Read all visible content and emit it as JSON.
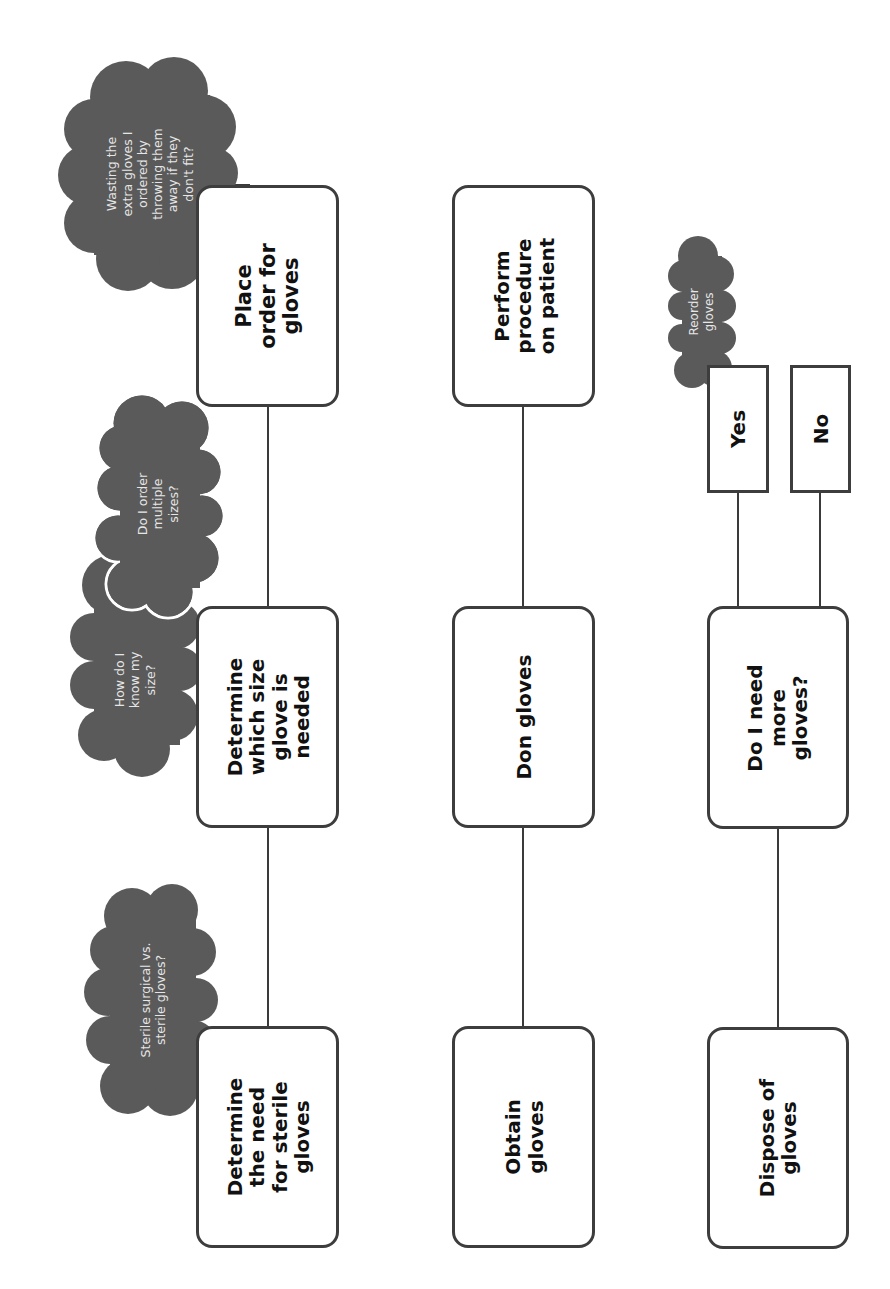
{
  "diagram": {
    "type": "flowchart",
    "orientation": "rotated-90-ccw",
    "colors": {
      "background": "#ffffff",
      "box_border": "#3d3d3d",
      "box_text": "#111111",
      "cloud_fill": "#5a5a5a",
      "cloud_text": "#e6e6e6",
      "connector": "#3a3a3a"
    },
    "columns": [
      {
        "steps": [
          {
            "id": "step-determine-need",
            "label": "Determine the need for sterile gloves"
          },
          {
            "id": "step-determine-size",
            "label": "Determine which size glove is needed"
          },
          {
            "id": "step-place-order",
            "label": "Place order for gloves"
          }
        ]
      },
      {
        "steps": [
          {
            "id": "step-obtain",
            "label": "Obtain gloves"
          },
          {
            "id": "step-don",
            "label": "Don gloves"
          },
          {
            "id": "step-perform",
            "label": "Perform procedure on patient"
          }
        ]
      },
      {
        "steps": [
          {
            "id": "step-dispose",
            "label": "Dispose of gloves"
          },
          {
            "id": "step-need-more",
            "label": "Do I need more gloves?"
          }
        ],
        "branches": [
          {
            "id": "branch-yes",
            "label": "Yes"
          },
          {
            "id": "branch-no",
            "label": "No"
          }
        ]
      }
    ],
    "clouds": [
      {
        "id": "cloud-sterile",
        "text": "Sterile surgical vs. sterile gloves?"
      },
      {
        "id": "cloud-know-size",
        "text": "How do I know my size?"
      },
      {
        "id": "cloud-multiple-sizes",
        "text": "Do I order multiple sizes?"
      },
      {
        "id": "cloud-wasting",
        "text": "Wasting the extra gloves I ordered by throwing them away if they don't fit?"
      },
      {
        "id": "cloud-reorder",
        "text": "Reorder gloves"
      }
    ]
  },
  "labels": {
    "place_order": [
      "Place",
      "order for",
      "gloves"
    ],
    "determine_size": [
      "Determine",
      "which size",
      "glove is",
      "needed"
    ],
    "determine_need": [
      "Determine",
      "the need",
      "for sterile",
      "gloves"
    ],
    "perform": [
      "Perform",
      "procedure",
      "on patient"
    ],
    "don": [
      "Don gloves"
    ],
    "obtain": [
      "Obtain",
      "gloves"
    ],
    "yes": [
      "Yes"
    ],
    "no": [
      "No"
    ],
    "need_more": [
      "Do I need",
      "more",
      "gloves?"
    ],
    "dispose": [
      "Dispose of",
      "gloves"
    ],
    "cloud_wasting": [
      "Wasting the",
      "extra gloves I",
      "ordered by",
      "throwing them",
      "away if they",
      "don't fit?"
    ],
    "cloud_multiple": [
      "Do I order",
      "multiple",
      "sizes?"
    ],
    "cloud_know": [
      "How do I",
      "know my",
      "size?"
    ],
    "cloud_sterile": [
      "Sterile surgical vs.",
      "sterile gloves?"
    ],
    "cloud_reorder": [
      "Reorder",
      "gloves"
    ]
  }
}
